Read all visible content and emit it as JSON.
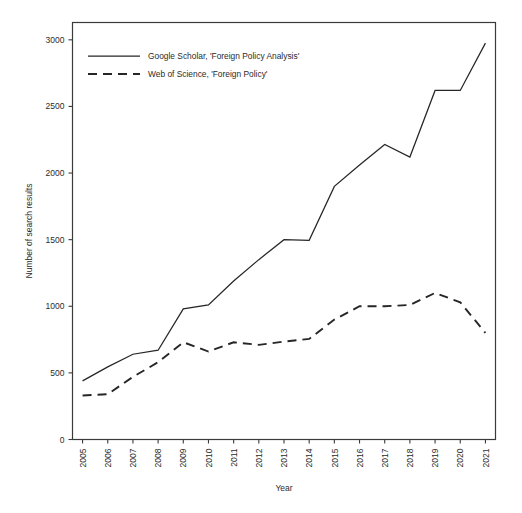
{
  "chart_data": {
    "type": "line",
    "title": "",
    "xlabel": "Year",
    "ylabel": "Number of search results",
    "x": [
      2005,
      2006,
      2007,
      2008,
      2009,
      2010,
      2011,
      2012,
      2013,
      2014,
      2015,
      2016,
      2017,
      2018,
      2019,
      2020,
      2021
    ],
    "xticklabels": [
      "2005",
      "2006",
      "2007",
      "2008",
      "2009",
      "2010",
      "2011",
      "2012",
      "2013",
      "2014",
      "2015",
      "2016",
      "2017",
      "2018",
      "2019",
      "2020",
      "2021"
    ],
    "yticklabels": [
      "0",
      "500",
      "1000",
      "1500",
      "2000",
      "2500",
      "3000"
    ],
    "yticks": [
      0,
      500,
      1000,
      1500,
      2000,
      2500,
      3000
    ],
    "ylim": [
      0,
      3130
    ],
    "xlim": [
      2004.6,
      2021.4
    ],
    "grid": false,
    "legend_position": "top-left",
    "series": [
      {
        "name": "Google Scholar, 'Foreign Policy Analysis'",
        "style": "solid",
        "color": "#262626",
        "values": [
          440,
          545,
          640,
          670,
          980,
          1010,
          1190,
          1350,
          1500,
          1495,
          1900,
          2060,
          2215,
          2120,
          2620,
          2620,
          2975
        ]
      },
      {
        "name": "Web of Science, 'Foreign Policy'",
        "style": "dashed",
        "color": "#262626",
        "values": [
          330,
          340,
          470,
          580,
          730,
          660,
          730,
          710,
          735,
          755,
          900,
          1000,
          1000,
          1010,
          1100,
          1030,
          800
        ]
      }
    ]
  },
  "legend": {
    "items": [
      {
        "label": "Google Scholar, 'Foreign Policy Analysis'",
        "style": "solid"
      },
      {
        "label": "Web of Science, 'Foreign Policy'",
        "style": "dashed"
      }
    ]
  },
  "axes": {
    "x_title": "Year",
    "y_title": "Number of search results"
  }
}
